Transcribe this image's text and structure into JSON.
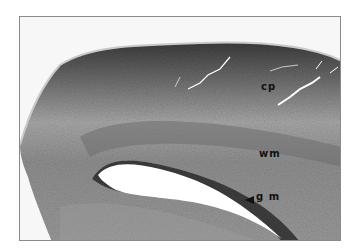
{
  "figure": {
    "type": "histology-micrograph",
    "colormode": "grayscale",
    "labels": [
      {
        "id": "cp",
        "text": "cp"
      },
      {
        "id": "wm",
        "text": "wm"
      },
      {
        "id": "gm",
        "text": "g m",
        "has_arrowhead": true
      }
    ],
    "colors": {
      "tissue_dark": "#3a3a3a",
      "tissue_mid": "#8c8c8c",
      "tissue_light": "#b5b5b5",
      "background": "#f7f7f7",
      "border": "#8a8a8a",
      "label": "#111111"
    }
  }
}
